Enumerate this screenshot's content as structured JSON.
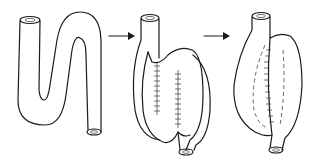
{
  "diagram": {
    "type": "process-sequence",
    "stages": [
      {
        "id": "stage-1",
        "description": "S-shaped folded tube (intestinal segment)"
      },
      {
        "id": "stage-2",
        "description": "Opened limbs sutured side-to-side (posterior wall)"
      },
      {
        "id": "stage-3",
        "description": "Closed pouch/reservoir with inner suture lines dashed"
      }
    ],
    "arrows": [
      {
        "from": "stage-1",
        "to": "stage-2"
      },
      {
        "from": "stage-2",
        "to": "stage-3"
      }
    ],
    "colors": {
      "stroke": "#1a1a1a",
      "background": "#ffffff"
    }
  }
}
